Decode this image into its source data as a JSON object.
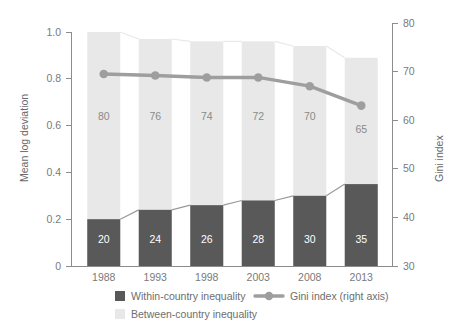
{
  "chart_data": {
    "type": "bar",
    "title": "",
    "subtitle": "",
    "xlabel": "",
    "ylabel": "Mean log deviation",
    "y2label": "Gini index",
    "categories": [
      "1988",
      "1993",
      "1998",
      "2003",
      "2008",
      "2013"
    ],
    "ylim": [
      0,
      1.0
    ],
    "yticks": [
      "0",
      "0.2",
      "0.4",
      "0.6",
      "0.8",
      "1.0"
    ],
    "ytick_values": [
      0,
      0.2,
      0.4,
      0.6,
      0.8,
      1.0
    ],
    "y2lim": [
      30,
      80
    ],
    "y2ticks": [
      "30",
      "40",
      "50",
      "60",
      "70",
      "80"
    ],
    "y2tick_values": [
      30,
      40,
      50,
      60,
      70,
      80
    ],
    "grid": false,
    "legend_position": "bottom",
    "stacked": true,
    "series": [
      {
        "name": "Within-country inequality",
        "type": "bar-segment",
        "color": "#595959",
        "labels": [
          "20",
          "24",
          "26",
          "28",
          "30",
          "35"
        ],
        "values": [
          0.2,
          0.24,
          0.26,
          0.28,
          0.3,
          0.35
        ],
        "share_percent": [
          20,
          24,
          26,
          28,
          30,
          35
        ]
      },
      {
        "name": "Between-country inequality",
        "type": "bar-segment",
        "color": "#e8e8e8",
        "labels": [
          "80",
          "76",
          "74",
          "72",
          "70",
          "65"
        ],
        "values": [
          0.8,
          0.73,
          0.71,
          0.69,
          0.66,
          0.54
        ],
        "share_percent": [
          80,
          76,
          74,
          72,
          70,
          65
        ]
      },
      {
        "name": "Gini index (right axis)",
        "type": "line",
        "color": "#9e9e9e",
        "axis": "right",
        "values": [
          69.5,
          69.2,
          68.8,
          68.8,
          67.0,
          63.0
        ]
      }
    ],
    "bar_totals": [
      1.0,
      0.97,
      0.96,
      0.96,
      0.94,
      0.89
    ]
  },
  "legend": {
    "items": [
      {
        "label": "Within-country inequality",
        "marker": "square",
        "color": "#595959"
      },
      {
        "label": "Between-country inequality",
        "marker": "square",
        "color": "#e8e8e8"
      },
      {
        "label": "Gini index (right axis)",
        "marker": "line-dot",
        "color": "#9e9e9e"
      }
    ]
  }
}
